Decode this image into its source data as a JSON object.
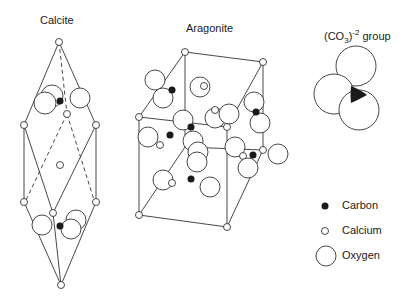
{
  "titles": {
    "calcite": "Calcite",
    "aragonite": "Aragonite",
    "group_prefix": "(CO",
    "group_sub": "3",
    "group_close": ")",
    "group_sup": "-2",
    "group_suffix": " group"
  },
  "legend": {
    "items": [
      {
        "symbol": "filled-small-circle",
        "label": "Carbon"
      },
      {
        "symbol": "open-small-circle",
        "label": "Calcium"
      },
      {
        "symbol": "open-large-circle",
        "label": "Oxygen"
      }
    ]
  },
  "colors": {
    "line": "#333333",
    "carbon": "#1a1a1a",
    "background": "#ffffff"
  }
}
